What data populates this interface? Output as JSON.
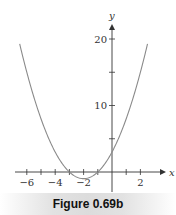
{
  "chart_data": {
    "type": "line",
    "title": "",
    "xlabel": "x",
    "ylabel": "y",
    "function": "y = x^2 + 4x + 3",
    "x": [
      -6.5,
      -6,
      -5,
      -4,
      -3,
      -2,
      -1,
      0,
      1,
      2,
      2.5
    ],
    "series": [
      {
        "name": "parabola",
        "values": [
          19.25,
          15,
          8,
          3,
          0,
          -1,
          0,
          3,
          8,
          15,
          19.25
        ]
      }
    ],
    "xlim": [
      -7,
      3
    ],
    "ylim": [
      -4,
      22
    ],
    "x_ticks": [
      -6,
      -5,
      -4,
      -3,
      -2,
      -1,
      0,
      1,
      2
    ],
    "x_tick_labels": [
      "−6",
      "−4",
      "−2",
      "2"
    ],
    "y_ticks": [
      5,
      10,
      15,
      20
    ],
    "y_tick_labels": [
      "10",
      "20"
    ],
    "grid": false,
    "line_color": "#8a8a8a",
    "axis_color": "#333333"
  },
  "caption": "Figure 0.69b"
}
